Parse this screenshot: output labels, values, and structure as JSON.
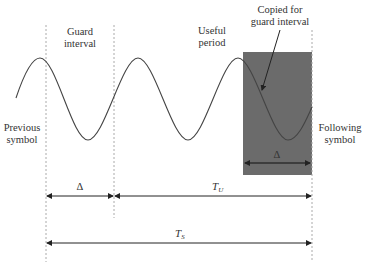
{
  "diagram": {
    "labels": {
      "guard_interval_line1": "Guard",
      "guard_interval_line2": "interval",
      "useful_period_line1": "Useful",
      "useful_period_line2": "period",
      "copied_line1": "Copied for",
      "copied_line2": "guard interval",
      "previous_line1": "Previous",
      "previous_line2": "symbol",
      "following_line1": "Following",
      "following_line2": "symbol"
    },
    "dimensions": {
      "guard_delta": "Δ",
      "copied_delta": "Δ",
      "useful_T": "T",
      "useful_sub": "U",
      "symbol_T": "T",
      "symbol_sub": "S"
    },
    "colors": {
      "shaded_region": "#6b6b6b",
      "wave": "#444444",
      "dashed": "#aaaaaa",
      "arrow": "#222222"
    }
  }
}
